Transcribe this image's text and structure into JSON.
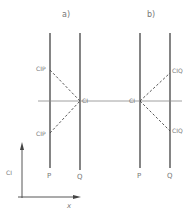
{
  "panels": {
    "a": {
      "title": "a)",
      "label_p": "P",
      "label_q": "Q",
      "center_point": "CI",
      "upper_point": "CIP",
      "lower_point": "CIP"
    },
    "b": {
      "title": "b)",
      "label_p": "P",
      "label_q": "Q",
      "center_point": "CI",
      "upper_point": "CIQ",
      "lower_point": "CIQ"
    }
  },
  "axes": {
    "y_label": "CI",
    "x_label": "x"
  },
  "colors": {
    "line": "#444444",
    "text": "#777777"
  }
}
